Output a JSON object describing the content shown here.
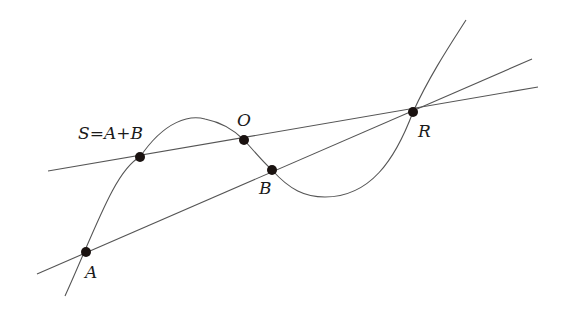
{
  "diagram": {
    "points": [
      {
        "id": "A",
        "label": "A",
        "x": 86,
        "y": 252
      },
      {
        "id": "B",
        "label": "B",
        "x": 272,
        "y": 170
      },
      {
        "id": "O",
        "label": "O",
        "x": 244,
        "y": 140
      },
      {
        "id": "R",
        "label": "R",
        "x": 413,
        "y": 112
      },
      {
        "id": "S",
        "label": "S=A+B",
        "x": 140,
        "y": 157
      }
    ],
    "lines": [
      {
        "id": "line-A-B-R",
        "from": [
          37,
          274
        ],
        "to": [
          532,
          59
        ]
      },
      {
        "id": "line-S-O-R",
        "from": [
          48,
          171
        ],
        "to": [
          538,
          87
        ]
      }
    ],
    "curve": {
      "id": "cubic-curve"
    },
    "colors": {
      "line": "#555555",
      "point": "#1a1210",
      "text": "#1a1a1a"
    }
  }
}
